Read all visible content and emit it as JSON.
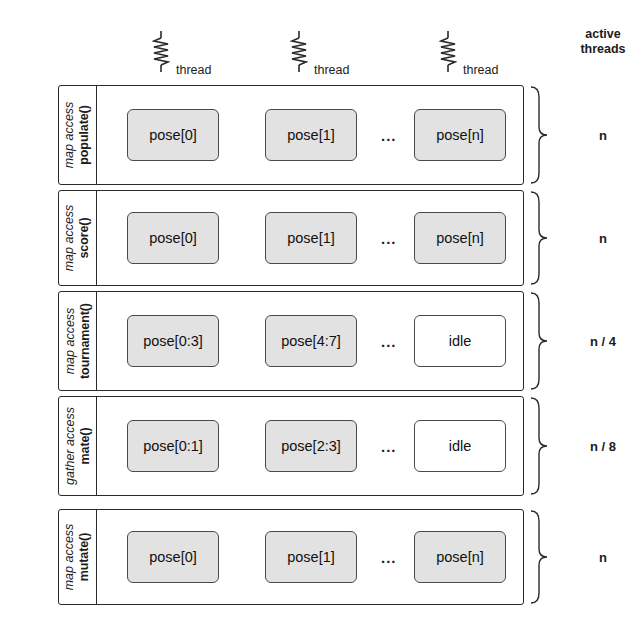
{
  "diagram": {
    "threads_header": [
      {
        "icon": "thread-squiggle-icon",
        "name": "thread",
        "index": "0"
      },
      {
        "icon": "thread-squiggle-icon",
        "name": "thread",
        "index": "1"
      },
      {
        "icon": "thread-squiggle-icon",
        "name": "thread",
        "index": "n"
      }
    ],
    "active_threads_header": {
      "line1": "active",
      "line2": "threads"
    },
    "ellipsis": "...",
    "rows": [
      {
        "function": "populate()",
        "access": "map access",
        "cells": [
          {
            "label": "pose[0]",
            "state": "active"
          },
          {
            "label": "pose[1]",
            "state": "active"
          },
          {
            "label": "pose[n]",
            "state": "active"
          }
        ],
        "active_threads": "n"
      },
      {
        "function": "score()",
        "access": "map access",
        "cells": [
          {
            "label": "pose[0]",
            "state": "active"
          },
          {
            "label": "pose[1]",
            "state": "active"
          },
          {
            "label": "pose[n]",
            "state": "active"
          }
        ],
        "active_threads": "n"
      },
      {
        "function": "tournament()",
        "access": "map access",
        "cells": [
          {
            "label": "pose[0:3]",
            "state": "active"
          },
          {
            "label": "pose[4:7]",
            "state": "active"
          },
          {
            "label": "idle",
            "state": "idle"
          }
        ],
        "active_threads": "n / 4"
      },
      {
        "function": "mate()",
        "access": "gather access",
        "cells": [
          {
            "label": "pose[0:1]",
            "state": "active"
          },
          {
            "label": "pose[2:3]",
            "state": "active"
          },
          {
            "label": "idle",
            "state": "idle"
          }
        ],
        "active_threads": "n / 8"
      },
      {
        "function": "mutate()",
        "access": "map access",
        "cells": [
          {
            "label": "pose[0]",
            "state": "active"
          },
          {
            "label": "pose[1]",
            "state": "active"
          },
          {
            "label": "pose[n]",
            "state": "active"
          }
        ],
        "active_threads": "n"
      }
    ],
    "colors": {
      "active_cell_fill": "#e2e2e2",
      "idle_cell_fill": "#ffffff",
      "stroke": "#2a2a2a",
      "background": "#ffffff"
    }
  }
}
